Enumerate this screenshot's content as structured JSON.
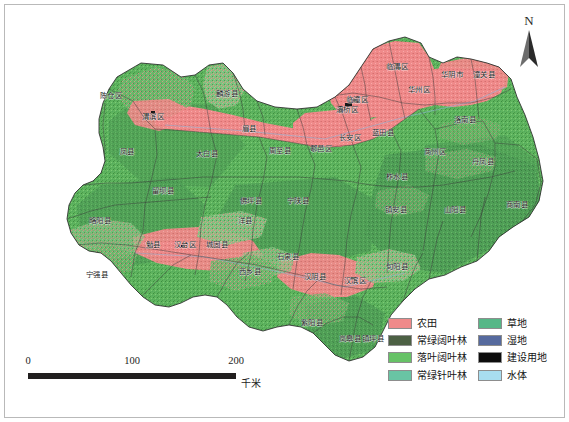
{
  "map": {
    "title": "",
    "region": "陕西省秦巴山区土地覆盖图",
    "background_color": "#ffffff",
    "frame_color": "#b9b9b9",
    "boundary_color": "#3a3a3a",
    "counties": [
      {
        "name": "陈仓区",
        "x": 106,
        "y": 91
      },
      {
        "name": "渭滨区",
        "x": 148,
        "y": 112
      },
      {
        "name": "凤县",
        "x": 122,
        "y": 147
      },
      {
        "name": "太白县",
        "x": 202,
        "y": 149
      },
      {
        "name": "麟游县",
        "x": 222,
        "y": 89
      },
      {
        "name": "眉县",
        "x": 244,
        "y": 124
      },
      {
        "name": "周至县",
        "x": 275,
        "y": 146
      },
      {
        "name": "鄠邑区",
        "x": 316,
        "y": 144
      },
      {
        "name": "长安区",
        "x": 345,
        "y": 133
      },
      {
        "name": "灞桥区",
        "x": 342,
        "y": 105
      },
      {
        "name": "临潼区",
        "x": 352,
        "y": 95
      },
      {
        "name": "临渭区",
        "x": 392,
        "y": 62
      },
      {
        "name": "华州区",
        "x": 414,
        "y": 85
      },
      {
        "name": "华阴市",
        "x": 447,
        "y": 70
      },
      {
        "name": "潼关县",
        "x": 479,
        "y": 70
      },
      {
        "name": "蓝田县",
        "x": 378,
        "y": 128
      },
      {
        "name": "洛南县",
        "x": 460,
        "y": 115
      },
      {
        "name": "商州区",
        "x": 430,
        "y": 147
      },
      {
        "name": "丹凤县",
        "x": 478,
        "y": 157
      },
      {
        "name": "商南县",
        "x": 512,
        "y": 200
      },
      {
        "name": "山阳县",
        "x": 450,
        "y": 205
      },
      {
        "name": "柞水县",
        "x": 392,
        "y": 172
      },
      {
        "name": "镇安县",
        "x": 391,
        "y": 205
      },
      {
        "name": "宁陕县",
        "x": 293,
        "y": 196
      },
      {
        "name": "佛坪县",
        "x": 246,
        "y": 196
      },
      {
        "name": "留坝县",
        "x": 158,
        "y": 186
      },
      {
        "name": "略阳县",
        "x": 95,
        "y": 216
      },
      {
        "name": "宁强县",
        "x": 92,
        "y": 270
      },
      {
        "name": "勉县",
        "x": 148,
        "y": 240
      },
      {
        "name": "汉台区",
        "x": 180,
        "y": 240
      },
      {
        "name": "城固县",
        "x": 212,
        "y": 240
      },
      {
        "name": "洋县",
        "x": 240,
        "y": 216
      },
      {
        "name": "西乡县",
        "x": 245,
        "y": 267
      },
      {
        "name": "石泉县",
        "x": 283,
        "y": 252
      },
      {
        "name": "汉阴县",
        "x": 310,
        "y": 272
      },
      {
        "name": "汉滨区",
        "x": 350,
        "y": 276
      },
      {
        "name": "旬阳县",
        "x": 392,
        "y": 262
      },
      {
        "name": "紫阳县",
        "x": 307,
        "y": 318
      },
      {
        "name": "岚皋县",
        "x": 345,
        "y": 334
      },
      {
        "name": "镇坪县",
        "x": 368,
        "y": 334
      }
    ]
  },
  "north_arrow": {
    "label": "N",
    "icon": "north-arrow-icon"
  },
  "scale_bar": {
    "ticks": [
      "0",
      "100",
      "200"
    ],
    "unit": "千米",
    "bar_color": "#211f1f"
  },
  "legend": {
    "columns": [
      {
        "items": [
          {
            "label": "农田",
            "color": "#ef8a8a"
          },
          {
            "label": "常绿阔叶林",
            "color": "#4c6044"
          },
          {
            "label": "落叶阔叶林",
            "color": "#67c267"
          },
          {
            "label": "常绿针叶林",
            "color": "#69c4a4"
          }
        ]
      },
      {
        "items": [
          {
            "label": "草地",
            "color": "#56b787"
          },
          {
            "label": "湿地",
            "color": "#566a9e"
          },
          {
            "label": "建设用地",
            "color": "#0d0d0d"
          },
          {
            "label": "水体",
            "color": "#a8ddf0"
          }
        ]
      }
    ]
  },
  "chart_data": {
    "type": "map",
    "projection_note": "",
    "legend_classes": [
      {
        "name": "农田",
        "color": "#ef8a8a"
      },
      {
        "name": "常绿阔叶林",
        "color": "#4c6044"
      },
      {
        "name": "落叶阔叶林",
        "color": "#67c267"
      },
      {
        "name": "常绿针叶林",
        "color": "#69c4a4"
      },
      {
        "name": "草地",
        "color": "#56b787"
      },
      {
        "name": "湿地",
        "color": "#566a9e"
      },
      {
        "name": "建设用地",
        "color": "#0d0d0d"
      },
      {
        "name": "水体",
        "color": "#a8ddf0"
      }
    ],
    "scale_km": [
      0,
      100,
      200
    ],
    "scale_unit": "千米",
    "north_up": true,
    "dominant_class": "落叶阔叶林",
    "cropland_band": "关中平原（渭河谷地）及汉中、安康盆地"
  }
}
